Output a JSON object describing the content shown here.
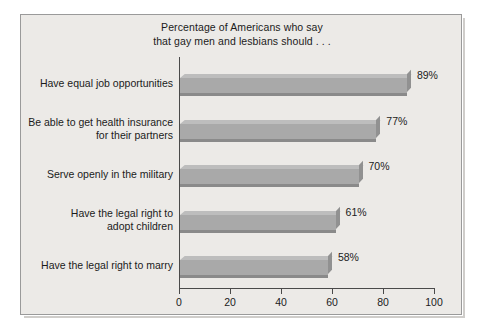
{
  "chart_data": {
    "type": "bar",
    "orientation": "horizontal",
    "title": "Percentage of Americans who say that gay men and lesbians should . . .",
    "title_lines": [
      "Percentage of Americans who say",
      "that gay men and lesbians should . . ."
    ],
    "xlabel": "",
    "ylabel": "",
    "xlim": [
      0,
      100
    ],
    "ylim": null,
    "grid": false,
    "legend": false,
    "categories": [
      "Have equal job opportunities",
      "Be able to get health insurance\nfor their partners",
      "Serve openly in the military",
      "Have the legal right to\nadopt children",
      "Have the legal right to marry"
    ],
    "values": [
      89,
      77,
      70,
      61,
      58
    ],
    "value_labels": [
      "89%",
      "77%",
      "70%",
      "61%",
      "58%"
    ],
    "xticks": [
      0,
      20,
      40,
      60,
      80,
      100
    ],
    "xtick_labels": [
      "0",
      "20",
      "40",
      "60",
      "80",
      "100"
    ],
    "colors": {
      "bar_front": "#a9a9a9",
      "bar_top": "#bdbdbd",
      "bar_side": "#919191",
      "bar_shadow": "#8a8a8a",
      "background": "#eceae7",
      "border": "#9a9a9a",
      "axis": "#4a4a4a",
      "text": "#1b1b1b"
    }
  }
}
